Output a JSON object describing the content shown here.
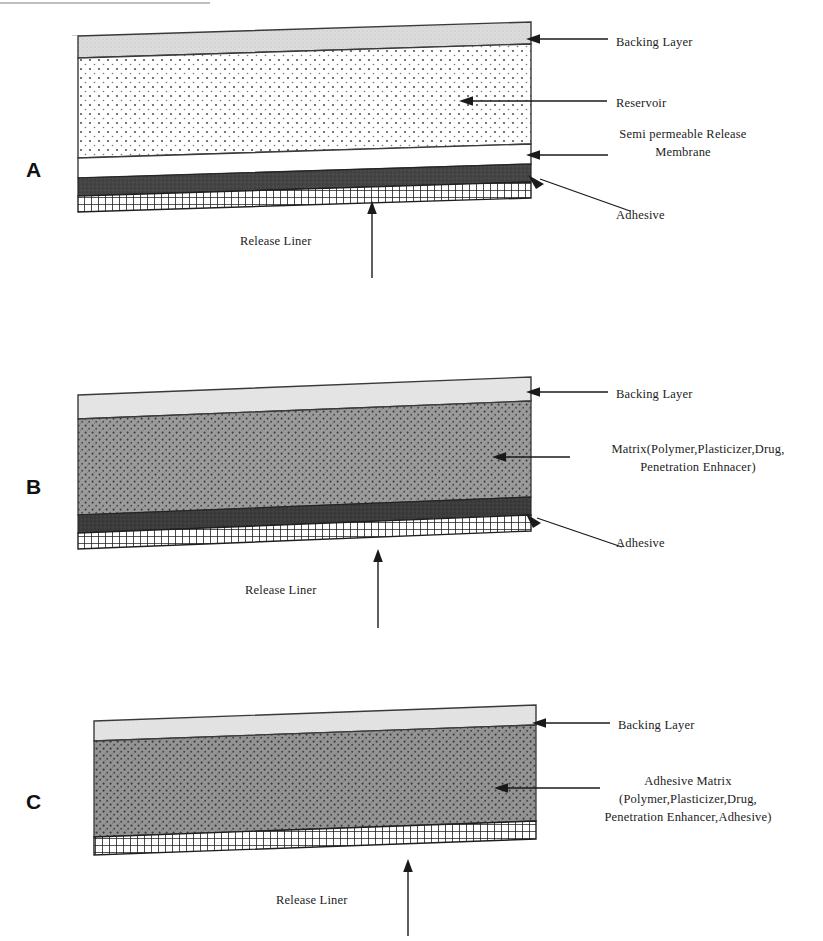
{
  "figure": {
    "type": "diagram",
    "panel_count": 3
  },
  "common_labels": {
    "backing_layer": "Backing Layer",
    "adhesive": "Adhesive",
    "release_liner": "Release Liner"
  },
  "panels": [
    {
      "letter": "A",
      "name": "reservoir-type-patch",
      "labels": {
        "backing": "Backing Layer",
        "reservoir": "Reservoir",
        "membrane": "Semi permeable Release\nMembrane",
        "adhesive": "Adhesive",
        "release_liner": "Release Liner"
      },
      "layers": [
        {
          "name": "backing-layer",
          "fill": "#dcdcdc",
          "pattern": "solid-light"
        },
        {
          "name": "reservoir",
          "fill": "#ffffff",
          "pattern": "fine-dots"
        },
        {
          "name": "semi-permeable-release-membrane",
          "fill": "#ffffff",
          "pattern": "plain"
        },
        {
          "name": "adhesive",
          "fill": "#4a4a4a",
          "pattern": "solid-dark"
        },
        {
          "name": "release-liner",
          "fill": "#ffffff",
          "pattern": "cross-hatch"
        }
      ]
    },
    {
      "letter": "B",
      "name": "matrix-type-patch",
      "labels": {
        "backing": "Backing Layer",
        "matrix": "Matrix(Polymer,Plasticizer,Drug,\nPenetration Enhnacer)",
        "adhesive": "Adhesive",
        "release_liner": "Release Liner"
      },
      "layers": [
        {
          "name": "backing-layer",
          "fill": "#e4e4e4",
          "pattern": "solid-light"
        },
        {
          "name": "matrix",
          "fill": "#9b9b9b",
          "pattern": "dense-dots"
        },
        {
          "name": "adhesive",
          "fill": "#3c3c3c",
          "pattern": "solid-dark"
        },
        {
          "name": "release-liner",
          "fill": "#ffffff",
          "pattern": "cross-hatch"
        }
      ]
    },
    {
      "letter": "C",
      "name": "drug-in-adhesive-patch",
      "labels": {
        "backing": "Backing Layer",
        "adhesive_matrix": "Adhesive Matrix\n(Polymer,Plasticizer,Drug,\nPenetration Enhancer,Adhesive)",
        "release_liner": "Release Liner"
      },
      "layers": [
        {
          "name": "backing-layer",
          "fill": "#e2e2e2",
          "pattern": "solid-light"
        },
        {
          "name": "adhesive-matrix",
          "fill": "#949494",
          "pattern": "dense-dots"
        },
        {
          "name": "release-liner",
          "fill": "#ffffff",
          "pattern": "cross-hatch"
        }
      ]
    }
  ],
  "colors": {
    "ink": "#1a1a1a",
    "outline": "#2a2a2a",
    "backing_light": "#dcdcdc",
    "matrix_gray": "#9b9b9b",
    "adhesive_dark": "#3e3e3e",
    "paper": "#ffffff"
  }
}
